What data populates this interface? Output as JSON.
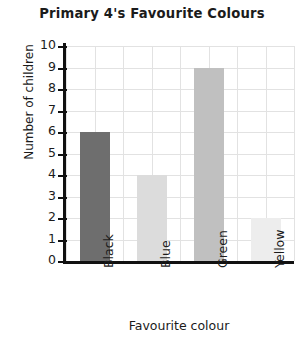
{
  "chart_data": {
    "type": "bar",
    "title": "Primary 4's Favourite Colours",
    "xlabel": "Favourite colour",
    "ylabel": "Number of children",
    "categories": [
      "Black",
      "Blue",
      "Green",
      "Yellow"
    ],
    "values": [
      6,
      4,
      9,
      2
    ],
    "bar_colors": [
      "#6e6e6e",
      "#dcdcdc",
      "#c0c0c0",
      "#ededed"
    ],
    "ylim": [
      0,
      10
    ],
    "ytick_labels": [
      "10",
      "9",
      "8",
      "7",
      "6",
      "5",
      "4",
      "3",
      "2",
      "1",
      "0"
    ],
    "ytick_values": [
      10,
      9,
      8,
      7,
      6,
      5,
      4,
      3,
      2,
      1,
      0
    ],
    "grid": true,
    "grid_color": "#e2e2e2",
    "axis_color": "#111111",
    "background": "#ffffff",
    "legend": null,
    "xtick_rotation": 90
  }
}
